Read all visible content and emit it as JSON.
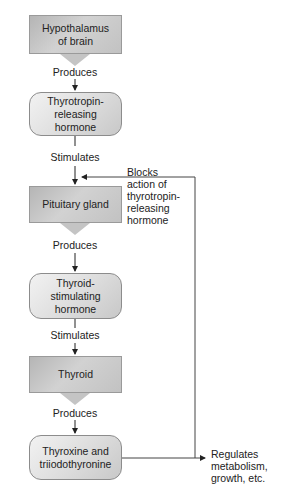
{
  "diagram": {
    "type": "flowchart",
    "title": "",
    "nodes": [
      {
        "id": "hypothalamus",
        "shape": "pointed-rect",
        "line1": "Hypothalamus",
        "line2": "of brain"
      },
      {
        "id": "trh",
        "shape": "rounded-rect",
        "line1": "Thyrotropin-",
        "line2": "releasing",
        "line3": "hormone"
      },
      {
        "id": "pituitary",
        "shape": "pointed-rect",
        "line1": "Pituitary gland"
      },
      {
        "id": "tsh",
        "shape": "rounded-rect",
        "line1": "Thyroid-",
        "line2": "stimulating",
        "line3": "hormone"
      },
      {
        "id": "thyroid",
        "shape": "pointed-rect",
        "line1": "Thyroid"
      },
      {
        "id": "t3t4",
        "shape": "rounded-rect",
        "line1": "Thyroxine and",
        "line2": "triiodothyronine"
      }
    ],
    "edge_labels": {
      "e1": "Produces",
      "e2": "Stimulates",
      "e3": "Produces",
      "e4": "Stimulates",
      "e5": "Produces"
    },
    "feedback": {
      "line1": "Blocks",
      "line2": "action of",
      "line3": "thyrotropin-",
      "line4": "releasing",
      "line5": "hormone"
    },
    "output": {
      "line1": "Regulates",
      "line2": "metabolism,",
      "line3": "growth, etc."
    }
  }
}
